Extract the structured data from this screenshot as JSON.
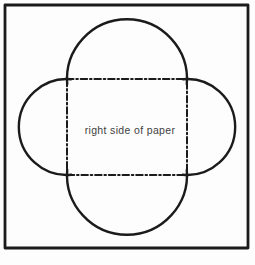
{
  "diagram": {
    "label": "right side of paper",
    "colors": {
      "background": "#fdfdfd",
      "line": "#1b1b1b",
      "text": "#3f3f3f"
    },
    "line_styles": {
      "outer_border": "solid",
      "flap_outline": "solid",
      "fold_line": "dash-dot"
    }
  }
}
